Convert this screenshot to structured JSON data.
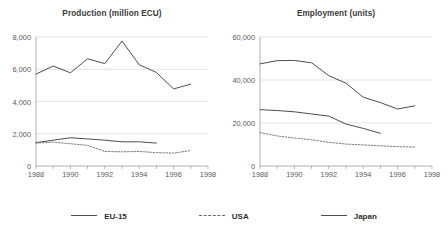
{
  "legend": {
    "position": "bottom",
    "items": [
      {
        "label": "EU-15",
        "style": "solid",
        "color": "#4d4d4d"
      },
      {
        "label": "USA",
        "style": "dashed",
        "color": "#6b6b6b"
      },
      {
        "label": "Japan",
        "style": "solid",
        "color": "#4d4d4d"
      }
    ]
  },
  "chart_data": [
    {
      "type": "line",
      "title": "Production (million ECU)",
      "xlabel": "",
      "ylabel": "",
      "xlim": [
        1988,
        1998
      ],
      "ylim": [
        0,
        8000
      ],
      "yticks": [
        0,
        2000,
        4000,
        6000,
        8000
      ],
      "yticklabels": [
        "0",
        "2,000",
        "4,000",
        "6,000",
        "8,000"
      ],
      "xticks": [
        1988,
        1989,
        1990,
        1991,
        1992,
        1993,
        1994,
        1995,
        1996,
        1997,
        1998
      ],
      "xticklabels": [
        "1988",
        "",
        "1990",
        "",
        "1992",
        "",
        "1994",
        "",
        "1996",
        "",
        "1998"
      ],
      "grid": "horizontal",
      "series": [
        {
          "name": "Japan",
          "style": "solid",
          "color": "#4d4d4d",
          "x": [
            1988,
            1989,
            1990,
            1991,
            1992,
            1993,
            1994,
            1995,
            1996,
            1997
          ],
          "values": [
            5700,
            6200,
            5780,
            6650,
            6350,
            7750,
            6280,
            5800,
            4780,
            5080
          ]
        },
        {
          "name": "EU-15",
          "style": "solid",
          "color": "#4d4d4d",
          "x": [
            1988,
            1989,
            1990,
            1991,
            1992,
            1993,
            1994,
            1995
          ],
          "values": [
            1450,
            1600,
            1750,
            1680,
            1600,
            1500,
            1500,
            1420
          ]
        },
        {
          "name": "USA",
          "style": "dashed",
          "color": "#6b6b6b",
          "x": [
            1988,
            1989,
            1990,
            1991,
            1992,
            1993,
            1994,
            1995,
            1996,
            1997
          ],
          "values": [
            1420,
            1480,
            1380,
            1280,
            900,
            880,
            900,
            830,
            800,
            960
          ]
        }
      ]
    },
    {
      "type": "line",
      "title": "Employment (units)",
      "xlabel": "",
      "ylabel": "",
      "xlim": [
        1988,
        1998
      ],
      "ylim": [
        0,
        60000
      ],
      "yticks": [
        0,
        20000,
        40000,
        60000
      ],
      "yticklabels": [
        "0",
        "20,000",
        "40,000",
        "60,000"
      ],
      "xticks": [
        1988,
        1989,
        1990,
        1991,
        1992,
        1993,
        1994,
        1995,
        1996,
        1997,
        1998
      ],
      "xticklabels": [
        "1988",
        "",
        "1990",
        "",
        "1992",
        "",
        "1994",
        "",
        "1996",
        "",
        "1998"
      ],
      "grid": "horizontal",
      "series": [
        {
          "name": "Japan",
          "style": "solid",
          "color": "#4d4d4d",
          "x": [
            1988,
            1989,
            1990,
            1991,
            1992,
            1993,
            1994,
            1995,
            1996,
            1997
          ],
          "values": [
            47500,
            49000,
            49100,
            48000,
            42000,
            38500,
            32000,
            29500,
            26500,
            28000
          ]
        },
        {
          "name": "EU-15",
          "style": "solid",
          "color": "#4d4d4d",
          "x": [
            1988,
            1989,
            1990,
            1991,
            1992,
            1993,
            1994,
            1995
          ],
          "values": [
            26200,
            25800,
            25200,
            24200,
            23200,
            19500,
            17500,
            15200
          ]
        },
        {
          "name": "USA",
          "style": "dashed",
          "color": "#6b6b6b",
          "x": [
            1988,
            1989,
            1990,
            1991,
            1992,
            1993,
            1994,
            1995,
            1996,
            1997
          ],
          "values": [
            15500,
            14000,
            13000,
            12200,
            11000,
            10200,
            9800,
            9400,
            9000,
            8800
          ]
        }
      ]
    }
  ]
}
